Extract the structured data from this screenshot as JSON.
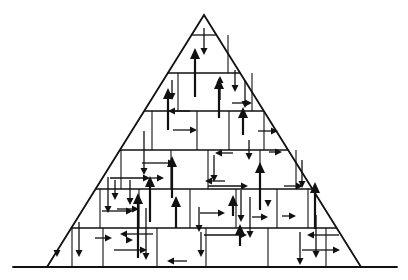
{
  "diagram": {
    "title": "",
    "colors": {
      "ink": "#111111",
      "background": "#ffffff"
    },
    "ground": {
      "x1": 13,
      "x2": 397,
      "y": 267
    },
    "pyramid": {
      "apex": [
        204,
        15
      ],
      "base_left": [
        47,
        267
      ],
      "base_right": [
        361,
        267
      ]
    },
    "courses_y": [
      35,
      73,
      111,
      150,
      189,
      228
    ],
    "joints": [
      [
        228,
        35,
        228,
        73
      ],
      [
        178,
        73,
        178,
        111
      ],
      [
        252,
        73,
        252,
        111
      ],
      [
        152,
        111,
        152,
        150
      ],
      [
        197,
        111,
        197,
        150
      ],
      [
        229,
        111,
        229,
        150
      ],
      [
        264,
        111,
        264,
        150
      ],
      [
        121,
        150,
        121,
        189
      ],
      [
        171,
        150,
        171,
        189
      ],
      [
        208,
        150,
        208,
        189
      ],
      [
        260,
        150,
        260,
        189
      ],
      [
        296,
        150,
        296,
        189
      ],
      [
        100,
        189,
        100,
        228
      ],
      [
        139,
        189,
        139,
        228
      ],
      [
        190,
        189,
        190,
        228
      ],
      [
        236,
        189,
        236,
        228
      ],
      [
        277,
        189,
        277,
        228
      ],
      [
        308,
        189,
        308,
        228
      ],
      [
        72,
        228,
        72,
        267
      ],
      [
        103,
        228,
        103,
        267
      ],
      [
        157,
        228,
        157,
        267
      ],
      [
        206,
        228,
        206,
        267
      ],
      [
        268,
        228,
        268,
        267
      ],
      [
        326,
        228,
        326,
        267
      ]
    ],
    "arrows": [
      {
        "x1": 204,
        "y1": 28,
        "x2": 204,
        "y2": 55,
        "w": 1.3,
        "head": "small"
      },
      {
        "x1": 195,
        "y1": 97,
        "x2": 195,
        "y2": 48,
        "w": 2.2,
        "head": "big"
      },
      {
        "x1": 220,
        "y1": 100,
        "x2": 220,
        "y2": 76,
        "w": 1.3,
        "head": "small"
      },
      {
        "x1": 245,
        "y1": 80,
        "x2": 245,
        "y2": 108,
        "w": 1.3,
        "head": "small"
      },
      {
        "x1": 172,
        "y1": 80,
        "x2": 172,
        "y2": 100,
        "w": 1.3,
        "head": "small"
      },
      {
        "x1": 219,
        "y1": 118,
        "x2": 219,
        "y2": 78,
        "w": 2.2,
        "head": "big"
      },
      {
        "x1": 190,
        "y1": 111,
        "x2": 168,
        "y2": 111,
        "w": 1.3,
        "head": "small"
      },
      {
        "x1": 232,
        "y1": 103,
        "x2": 252,
        "y2": 103,
        "w": 1.3,
        "head": "small"
      },
      {
        "x1": 168,
        "y1": 130,
        "x2": 168,
        "y2": 88,
        "w": 2.2,
        "head": "big"
      },
      {
        "x1": 243,
        "y1": 135,
        "x2": 243,
        "y2": 107,
        "w": 2.2,
        "head": "big"
      },
      {
        "x1": 235,
        "y1": 70,
        "x2": 235,
        "y2": 92,
        "w": 1.3,
        "head": "small"
      },
      {
        "x1": 173,
        "y1": 130,
        "x2": 197,
        "y2": 130,
        "w": 1.3,
        "head": "small"
      },
      {
        "x1": 249,
        "y1": 140,
        "x2": 249,
        "y2": 160,
        "w": 1.3,
        "head": "small"
      },
      {
        "x1": 233,
        "y1": 153,
        "x2": 215,
        "y2": 153,
        "w": 1.3,
        "head": "small"
      },
      {
        "x1": 258,
        "y1": 131,
        "x2": 278,
        "y2": 131,
        "w": 1.3,
        "head": "small"
      },
      {
        "x1": 269,
        "y1": 152,
        "x2": 282,
        "y2": 152,
        "w": 1.3,
        "head": "small"
      },
      {
        "x1": 144,
        "y1": 131,
        "x2": 144,
        "y2": 175,
        "w": 1.3,
        "head": "small"
      },
      {
        "x1": 172,
        "y1": 198,
        "x2": 172,
        "y2": 156,
        "w": 2.2,
        "head": "big"
      },
      {
        "x1": 214,
        "y1": 155,
        "x2": 214,
        "y2": 182,
        "w": 1.3,
        "head": "small"
      },
      {
        "x1": 260,
        "y1": 210,
        "x2": 260,
        "y2": 162,
        "w": 2.2,
        "head": "big"
      },
      {
        "x1": 142,
        "y1": 163,
        "x2": 175,
        "y2": 163,
        "w": 1.3,
        "head": "small"
      },
      {
        "x1": 225,
        "y1": 181,
        "x2": 205,
        "y2": 181,
        "w": 1.3,
        "head": "small"
      },
      {
        "x1": 302,
        "y1": 160,
        "x2": 302,
        "y2": 188,
        "w": 1.3,
        "head": "small"
      },
      {
        "x1": 315,
        "y1": 229,
        "x2": 315,
        "y2": 182,
        "w": 2.2,
        "head": "big"
      },
      {
        "x1": 284,
        "y1": 186,
        "x2": 303,
        "y2": 186,
        "w": 1.3,
        "head": "small"
      },
      {
        "x1": 115,
        "y1": 180,
        "x2": 115,
        "y2": 200,
        "w": 1.3,
        "head": "small"
      },
      {
        "x1": 130,
        "y1": 180,
        "x2": 130,
        "y2": 205,
        "w": 1.3,
        "head": "small"
      },
      {
        "x1": 117,
        "y1": 209,
        "x2": 139,
        "y2": 209,
        "w": 1.3,
        "head": "small"
      },
      {
        "x1": 108,
        "y1": 177,
        "x2": 108,
        "y2": 213,
        "w": 1.3,
        "head": "small"
      },
      {
        "x1": 150,
        "y1": 222,
        "x2": 150,
        "y2": 176,
        "w": 2.2,
        "head": "big"
      },
      {
        "x1": 110,
        "y1": 178,
        "x2": 150,
        "y2": 178,
        "w": 1.3,
        "head": "small"
      },
      {
        "x1": 150,
        "y1": 178,
        "x2": 164,
        "y2": 178,
        "w": 1.3,
        "head": "small"
      },
      {
        "x1": 102,
        "y1": 211,
        "x2": 133,
        "y2": 211,
        "w": 1.3,
        "head": "small"
      },
      {
        "x1": 199,
        "y1": 207,
        "x2": 199,
        "y2": 232,
        "w": 1.3,
        "head": "small"
      },
      {
        "x1": 200,
        "y1": 213,
        "x2": 225,
        "y2": 213,
        "w": 1.3,
        "head": "small"
      },
      {
        "x1": 176,
        "y1": 228,
        "x2": 176,
        "y2": 196,
        "w": 2.2,
        "head": "big"
      },
      {
        "x1": 241,
        "y1": 190,
        "x2": 241,
        "y2": 222,
        "w": 1.3,
        "head": "small"
      },
      {
        "x1": 208,
        "y1": 186,
        "x2": 248,
        "y2": 186,
        "w": 1.3,
        "head": "small"
      },
      {
        "x1": 233,
        "y1": 216,
        "x2": 233,
        "y2": 195,
        "w": 2.2,
        "head": "big"
      },
      {
        "x1": 268,
        "y1": 200,
        "x2": 268,
        "y2": 207,
        "w": 1.3,
        "head": "small"
      },
      {
        "x1": 250,
        "y1": 197,
        "x2": 250,
        "y2": 238,
        "w": 1.3,
        "head": "small"
      },
      {
        "x1": 252,
        "y1": 217,
        "x2": 268,
        "y2": 217,
        "w": 1.3,
        "head": "small"
      },
      {
        "x1": 282,
        "y1": 216,
        "x2": 296,
        "y2": 216,
        "w": 1.3,
        "head": "small"
      },
      {
        "x1": 240,
        "y1": 246,
        "x2": 240,
        "y2": 224,
        "w": 2.2,
        "head": "big"
      },
      {
        "x1": 204,
        "y1": 235,
        "x2": 247,
        "y2": 235,
        "w": 1.3,
        "head": "small"
      },
      {
        "x1": 300,
        "y1": 232,
        "x2": 300,
        "y2": 265,
        "w": 1.3,
        "head": "small"
      },
      {
        "x1": 339,
        "y1": 235,
        "x2": 307,
        "y2": 235,
        "w": 1.3,
        "head": "small"
      },
      {
        "x1": 302,
        "y1": 250,
        "x2": 340,
        "y2": 250,
        "w": 1.3,
        "head": "small"
      },
      {
        "x1": 316,
        "y1": 215,
        "x2": 316,
        "y2": 258,
        "w": 1.3,
        "head": "small"
      },
      {
        "x1": 79,
        "y1": 222,
        "x2": 79,
        "y2": 257,
        "w": 1.3,
        "head": "small"
      },
      {
        "x1": 95,
        "y1": 238,
        "x2": 112,
        "y2": 238,
        "w": 1.3,
        "head": "small"
      },
      {
        "x1": 114,
        "y1": 250,
        "x2": 147,
        "y2": 250,
        "w": 1.3,
        "head": "small"
      },
      {
        "x1": 138,
        "y1": 258,
        "x2": 138,
        "y2": 193,
        "w": 2.2,
        "head": "big"
      },
      {
        "x1": 153,
        "y1": 234,
        "x2": 120,
        "y2": 234,
        "w": 1.3,
        "head": "small"
      },
      {
        "x1": 128,
        "y1": 240,
        "x2": 133,
        "y2": 240,
        "w": 1.3,
        "head": "small"
      },
      {
        "x1": 146,
        "y1": 208,
        "x2": 146,
        "y2": 260,
        "w": 1.3,
        "head": "small"
      },
      {
        "x1": 201,
        "y1": 232,
        "x2": 201,
        "y2": 257,
        "w": 1.3,
        "head": "small"
      },
      {
        "x1": 187,
        "y1": 261,
        "x2": 167,
        "y2": 261,
        "w": 1.3,
        "head": "small"
      },
      {
        "x1": 57,
        "y1": 254,
        "x2": 57,
        "y2": 257,
        "w": 1.3,
        "head": "small"
      }
    ]
  }
}
